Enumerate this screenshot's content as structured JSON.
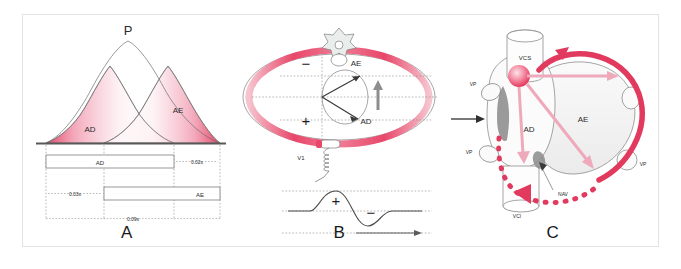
{
  "figure": {
    "background_color": "#ffffff",
    "border_color": "#e2e2e2",
    "accent_red": "#e23a5e",
    "accent_pink": "#f3a9bb",
    "accent_pale": "#fbe3e9",
    "ink": "#2b2b2b"
  },
  "panels": [
    {
      "letter": "A",
      "name": "p-wave-composition",
      "labels": {
        "p_wave": "P",
        "right_atrium": "AD",
        "left_atrium": "AE",
        "bar_right_atrium": "AD",
        "bar_left_atrium": "AE"
      },
      "timings": {
        "onset_offset_left": "0.03s",
        "onset_offset_right": "0.02s",
        "total_duration": "0.09s"
      }
    },
    {
      "letter": "B",
      "name": "thorax-cross-section-v1",
      "labels": {
        "left_atrium": "AE",
        "right_atrium": "AD",
        "electrode": "V1",
        "negative_pole": "−",
        "positive_pole": "+",
        "wave_positive": "+",
        "wave_negative": "−"
      }
    },
    {
      "letter": "C",
      "name": "heart-conduction-anatomy",
      "labels": {
        "superior_vena_cava": "VCS",
        "inferior_vena_cava": "VCI",
        "pulmonary_vein_upper_left": "VP",
        "pulmonary_vein_lower_left": "VP",
        "pulmonary_vein_right": "VP",
        "right_atrium": "AD",
        "left_atrium": "AE",
        "av_node": "NAV"
      }
    }
  ]
}
